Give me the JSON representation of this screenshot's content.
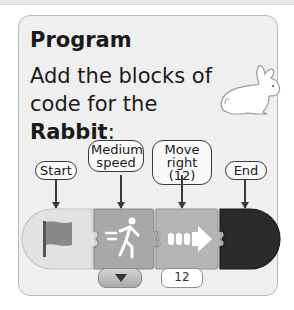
{
  "card": {
    "title": "Program",
    "instruction_line1": "Add the blocks of",
    "instruction_line2_prefix": "code for the ",
    "instruction_subject": "Rabbit",
    "instruction_suffix": ":",
    "image": "rabbit-illustration"
  },
  "labels": [
    {
      "id": "start",
      "line1": "Start",
      "line2": ""
    },
    {
      "id": "medium-speed",
      "line1": "Medium",
      "line2": "speed"
    },
    {
      "id": "move-right",
      "line1": "Move",
      "line2": "right (12)"
    },
    {
      "id": "end",
      "line1": "End",
      "line2": ""
    }
  ],
  "blocks": [
    {
      "name": "start-flag-block",
      "icon": "flag-icon"
    },
    {
      "name": "speed-block",
      "icon": "running-person-icon",
      "dropdown": "chevron-down-icon"
    },
    {
      "name": "move-right-block",
      "icon": "arrow-right-icon",
      "value": "12"
    },
    {
      "name": "end-block",
      "icon": ""
    }
  ]
}
